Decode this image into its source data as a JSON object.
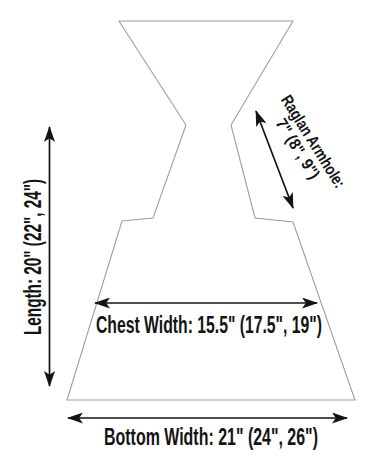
{
  "figure": {
    "kind": "garment-pattern-schematic",
    "labels": {
      "length": "Length: 20\" (22\", 24\")",
      "raglan_line1": "Raglan Armhole:",
      "raglan_line2": "7\" (8\", 9\")",
      "chest_width": "Chest Width: 15.5\" (17.5\", 19\")",
      "bottom_width": "Bottom Width: 21\" (24\", 26\")"
    },
    "measurements": {
      "length": "20\" (22\", 24\")",
      "raglan_armhole": "7\" (8\", 9\")",
      "chest_width": "15.5\" (17.5\", 19\")",
      "bottom_width": "21\" (24\", 26\")"
    },
    "colors": {
      "ink": "#141414",
      "outline": "#9f9f9f",
      "background": "#ffffff"
    }
  }
}
